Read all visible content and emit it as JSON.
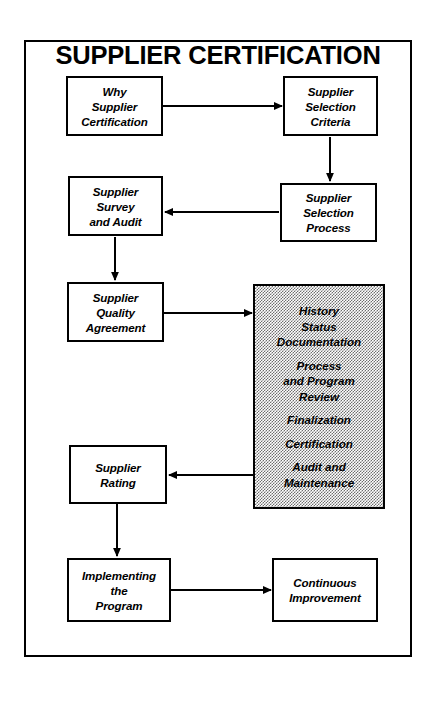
{
  "diagram": {
    "title": "SUPPLIER CERTIFICATION",
    "nodes": {
      "why_supplier_certification": {
        "lines": [
          "Why",
          "Supplier",
          "Certification"
        ]
      },
      "supplier_selection_criteria": {
        "lines": [
          "Supplier",
          "Selection",
          "Criteria"
        ]
      },
      "supplier_survey_and_audit": {
        "lines": [
          "Supplier",
          "Survey",
          "and Audit"
        ]
      },
      "supplier_selection_process": {
        "lines": [
          "Supplier",
          "Selection",
          "Process"
        ]
      },
      "supplier_quality_agreement": {
        "lines": [
          "Supplier",
          "Quality",
          "Agreement"
        ]
      },
      "supplier_rating": {
        "lines": [
          "Supplier",
          "Rating"
        ]
      },
      "implementing_the_program": {
        "lines": [
          "Implementing",
          "the",
          "Program"
        ]
      },
      "continuous_improvement": {
        "lines": [
          "Continuous",
          "Improvement"
        ]
      },
      "certification_activities": {
        "groups": [
          {
            "lines": [
              "History",
              "Status",
              "Documentation"
            ]
          },
          {
            "lines": [
              "Process",
              "and Program",
              "Review"
            ]
          },
          {
            "lines": [
              "Finalization"
            ]
          },
          {
            "lines": [
              "Certification"
            ]
          },
          {
            "lines": [
              "Audit and",
              "Maintenance"
            ]
          }
        ]
      }
    },
    "colors": {
      "line": "#000000",
      "node_fill": "#ffffff",
      "shaded_fill": "#b0b0b0",
      "border": "#000000",
      "background": "#ffffff"
    }
  }
}
